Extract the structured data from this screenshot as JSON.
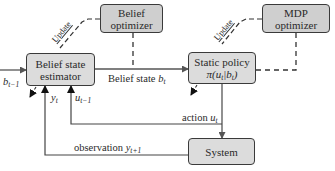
{
  "diagram": {
    "type": "block-diagram",
    "nodes": {
      "belief_optimizer": {
        "line1": "Belief",
        "line2": "optimizer"
      },
      "mdp_optimizer": {
        "line1": "MDP",
        "line2": "optimizer"
      },
      "belief_state_estimator": {
        "line1": "Belief state",
        "line2": "estimator"
      },
      "static_policy": {
        "line1": "Static policy",
        "line2": "π(u",
        "line2_sub": "t",
        "line2_mid": "|b",
        "line2_sub2": "t",
        "line2_end": ")"
      },
      "system": {
        "label": "System"
      }
    },
    "edges": {
      "update_left": "Update",
      "update_right": "Update",
      "input": {
        "var": "b",
        "sub": "t−1"
      },
      "belief_state": {
        "text": "Belief state",
        "var": "b",
        "sub": "t"
      },
      "action": {
        "text": "action",
        "var": "u",
        "sub": "t"
      },
      "observation": {
        "text": "observation",
        "var": "y",
        "sub": "t+1"
      },
      "feedback_y": {
        "var": "y",
        "sub": "t"
      },
      "feedback_u": {
        "var": "u",
        "sub": "t−1"
      }
    },
    "colors": {
      "box_fill": "#dcdcdc",
      "line": "#3a3a3a",
      "arrow_gray": "#666666"
    }
  }
}
